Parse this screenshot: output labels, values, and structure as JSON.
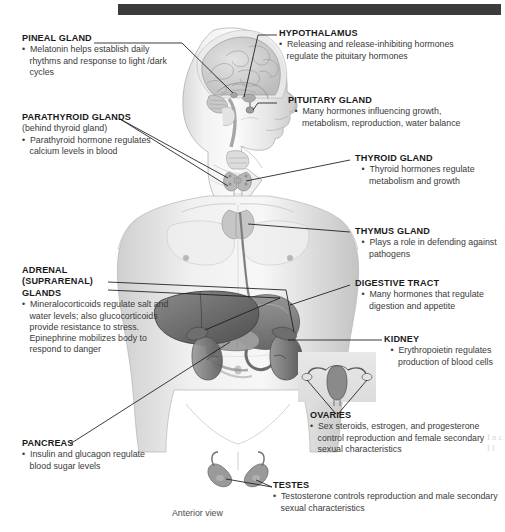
{
  "figure": {
    "caption": "Anterior view",
    "top_bar_color": "#3b3b3b",
    "background_color": "#ffffff"
  },
  "labels": [
    {
      "id": "pineal-gland",
      "title": "PINEAL GLAND",
      "subtitle": "",
      "bullets": [
        "Melatonin helps establish daily rhythms and response to light /dark cycles"
      ]
    },
    {
      "id": "parathyroid-glands",
      "title": "PARATHYROID GLANDS",
      "subtitle": "(behind thyroid gland)",
      "bullets": [
        "Parathyroid hormone regulates calcium levels in blood"
      ]
    },
    {
      "id": "adrenal-glands",
      "title": "ADRENAL (SUPRARENAL) GLANDS",
      "subtitle": "",
      "bullets": [
        "Mineralocorticoids regulate salt and water levels; also glucocorticoids provide resistance to stress. Epinephrine mobilizes body to respond to danger"
      ]
    },
    {
      "id": "pancreas",
      "title": "PANCREAS",
      "subtitle": "",
      "bullets": [
        "Insulin and glucagon regulate blood sugar levels"
      ]
    },
    {
      "id": "hypothalamus",
      "title": "HYPOTHALAMUS",
      "subtitle": "",
      "bullets": [
        "Releasing and release-inhibiting hormones regulate the pituitary hormones"
      ]
    },
    {
      "id": "pituitary-gland",
      "title": "PITUITARY GLAND",
      "subtitle": "",
      "bullets": [
        "Many hormones influencing growth, metabolism, reproduction, water balance"
      ]
    },
    {
      "id": "thyroid-gland",
      "title": "THYROID GLAND",
      "subtitle": "",
      "bullets": [
        "Thyroid hormones regulate metabolism and growth"
      ]
    },
    {
      "id": "thymus-gland",
      "title": "THYMUS GLAND",
      "subtitle": "",
      "bullets": [
        "Plays a role in defending against pathogens"
      ]
    },
    {
      "id": "digestive-tract",
      "title": "DIGESTIVE TRACT",
      "subtitle": "",
      "bullets": [
        "Many hormones that regulate digestion and appetite"
      ]
    },
    {
      "id": "kidney",
      "title": "KIDNEY",
      "subtitle": "",
      "bullets": [
        "Erythropoietin regulates production of blood cells"
      ]
    },
    {
      "id": "ovaries",
      "title": "OVARIES",
      "subtitle": "",
      "bullets": [
        "Sex steroids, estrogen, and progesterone control reproduction and female secondary sexual characteristics"
      ]
    },
    {
      "id": "testes",
      "title": "TESTES",
      "subtitle": "",
      "bullets": [
        "Testosterone controls reproduction and male secondary sexual characteristics"
      ]
    }
  ]
}
